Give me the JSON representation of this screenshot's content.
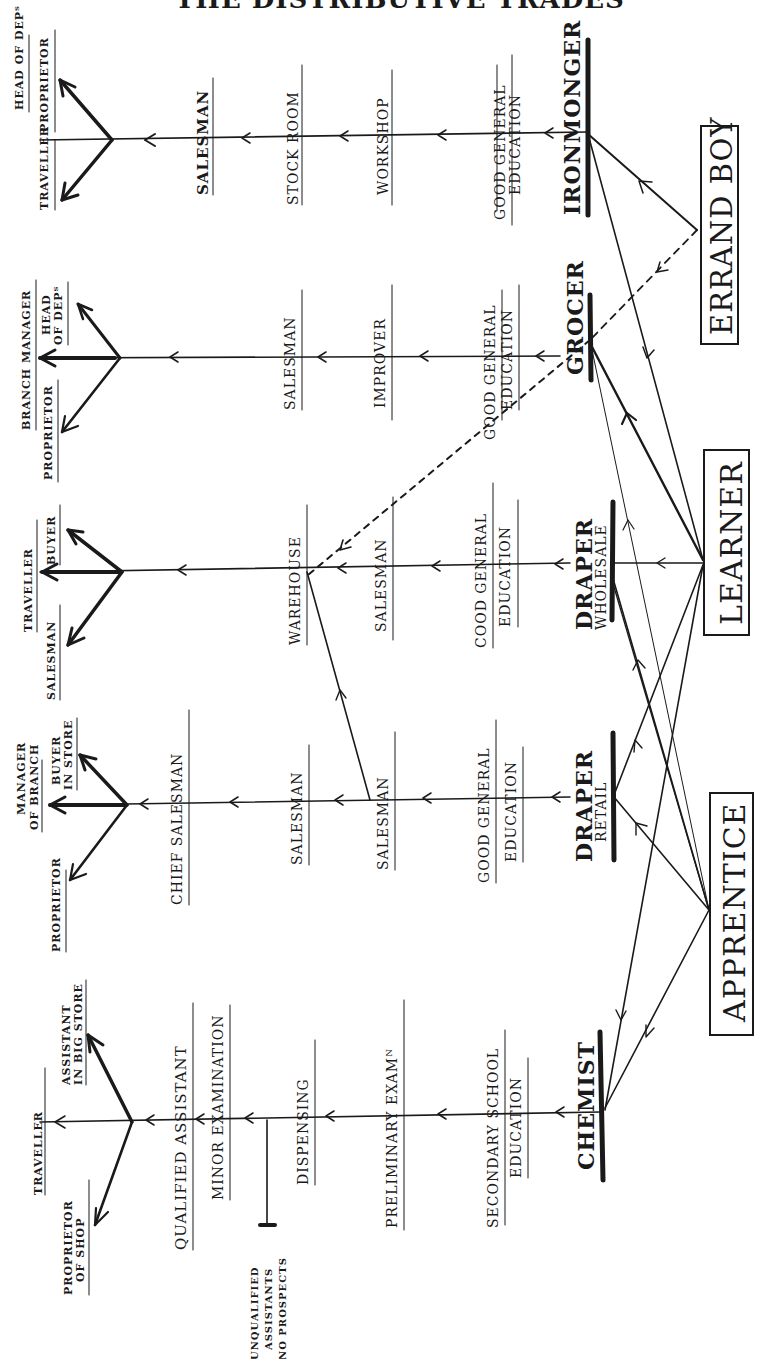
{
  "header": {
    "title": "THE DISTRIBUTIVE TRADES"
  },
  "entry_boxes": [
    {
      "id": "errand_boy",
      "label": "ERRAND BOY"
    },
    {
      "id": "learner",
      "label": "LEARNER"
    },
    {
      "id": "apprentice",
      "label": "APPRENTICE"
    }
  ],
  "trades": [
    {
      "name": "IRONMONGER",
      "steps": [
        [
          "GOOD GENERAL",
          "EDUCATION"
        ],
        [
          "WORKSHOP"
        ],
        [
          "STOCK ROOM"
        ],
        [
          "SALESMAN"
        ]
      ],
      "outcomes": [
        [
          "HEAD OF DEPᵀ"
        ],
        [
          "TRAVELLER"
        ],
        [
          "PROPRIETOR"
        ]
      ]
    },
    {
      "name": "GROCER",
      "steps": [
        [
          "GOOD GENERAL",
          "EDUCATION"
        ],
        [
          "IMPROVER"
        ],
        [
          "SALESMAN"
        ]
      ],
      "outcomes": [
        [
          "BRANCH MANAGER"
        ],
        [
          "PROPRIETOR"
        ],
        [
          "HEAD",
          "OF DEPᵀ"
        ]
      ]
    },
    {
      "name": "DRAPER",
      "sub": "WHOLESALE",
      "steps": [
        [
          "COOD GENERAL",
          "EDUCATION"
        ],
        [
          "SALESMAN"
        ],
        [
          "WAREHOUSE"
        ]
      ],
      "outcomes": [
        [
          "TRAVELLER"
        ],
        [
          "SALESMAN"
        ],
        [
          "BUYER"
        ]
      ]
    },
    {
      "name": "DRAPER",
      "sub": "RETAIL",
      "steps": [
        [
          "GOOD GENERAL",
          "EDUCATION"
        ],
        [
          "SALESMAN"
        ],
        [
          "SALESMAN"
        ],
        [
          "CHIEF SALESMAN"
        ]
      ],
      "outcomes": [
        [
          "MANAGER",
          "OF BRANCH"
        ],
        [
          "PROPRIETOR"
        ],
        [
          "BUYER",
          "IN STORE"
        ]
      ]
    },
    {
      "name": "CHEMIST",
      "steps": [
        [
          "SECONDARY SCHOOL",
          "EDUCATION"
        ],
        [
          "PRELIMINARY EXAMᴺ"
        ],
        [
          "DISPENSING"
        ],
        [
          "MINOR EXAMINATION"
        ],
        [
          "QUALIFIED ASSISTANT"
        ]
      ],
      "outcomes": [
        [
          "TRAVELLER"
        ],
        [
          "PROPRIETOR",
          "OF SHOP"
        ],
        [
          "ASSISTANT",
          "IN BIG STORE"
        ]
      ],
      "dead_end": [
        "UNQUALIFIED",
        "ASSISTANTS",
        "NO PROSPECTS"
      ]
    }
  ]
}
